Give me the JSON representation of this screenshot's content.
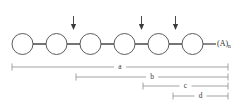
{
  "diagram": {
    "colors": {
      "background": "#ffffff",
      "node_stroke": "#4a4a4a",
      "node_fill": "#ffffff",
      "bond": "#2b2b2b",
      "arrow": "#3a3a3a",
      "measure": "#7d7d7d",
      "label_text": "#3a3a3a"
    },
    "chain": {
      "node_count": 6,
      "node_radius": 10.5,
      "node_centers_x": [
        22.5,
        56.5,
        90.5,
        124.5,
        158.5,
        192.5
      ],
      "node_center_y": 44,
      "nodes": [
        {
          "index": 0,
          "label": ""
        },
        {
          "index": 1,
          "label": ""
        },
        {
          "index": 2,
          "label": ""
        },
        {
          "index": 3,
          "label": ""
        },
        {
          "index": 4,
          "label": ""
        },
        {
          "index": 5,
          "label": ""
        }
      ],
      "terminal_label": "(A)",
      "terminal_subscript": "n",
      "terminal_label_x": 219,
      "terminal_bond": {
        "x1": 203,
        "x2": 216
      }
    },
    "arrows": [
      {
        "name": "arrow-1",
        "x": 73.5,
        "y_top": 16,
        "y_bottom": 30
      },
      {
        "name": "arrow-2",
        "x": 141.5,
        "y_top": 16,
        "y_bottom": 30
      },
      {
        "name": "arrow-3",
        "x": 175.5,
        "y_top": 16,
        "y_bottom": 30
      }
    ],
    "measures": [
      {
        "id": "a",
        "label": "a",
        "x1": 12,
        "x2": 228,
        "y": 67
      },
      {
        "id": "b",
        "label": "b",
        "x1": 76,
        "x2": 228,
        "y": 77
      },
      {
        "id": "c",
        "label": "c",
        "x1": 143,
        "x2": 228,
        "y": 86
      },
      {
        "id": "d",
        "label": "d",
        "x1": 173,
        "x2": 228,
        "y": 96
      }
    ]
  }
}
